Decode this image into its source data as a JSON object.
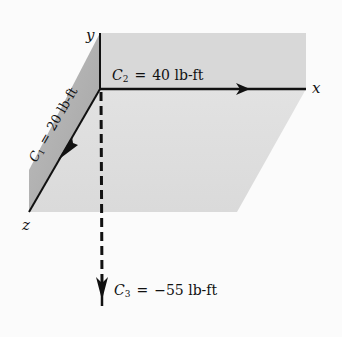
{
  "diagram": {
    "axes": {
      "x_label": "x",
      "y_label": "y",
      "z_label": "z"
    },
    "couples": [
      {
        "symbol": "C",
        "subscript": "1",
        "equals": "=",
        "value": "20 lb-ft",
        "direction": "+z"
      },
      {
        "symbol": "C",
        "subscript": "2",
        "equals": "=",
        "value": "40 lb-ft",
        "direction": "+x"
      },
      {
        "symbol": "C",
        "subscript": "3",
        "equals": "=",
        "value": "−55 lb-ft",
        "direction": "-y (dashed)"
      }
    ],
    "colors": {
      "background": "#fbfbfb",
      "face_light": "#dcdcdc",
      "face_side": "#a9a9a9",
      "face_front": "#e6e6e6",
      "ink": "#111111"
    }
  }
}
